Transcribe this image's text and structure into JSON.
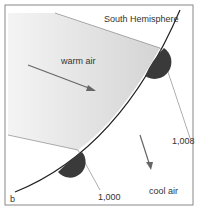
{
  "diagram": {
    "title": "South Hemisphere",
    "panel_label": "b",
    "regions": {
      "warm": "warm air",
      "cool": "cool air"
    },
    "isobars": [
      "1,008",
      "1,000"
    ],
    "front_type": "warm front",
    "colors": {
      "front_line": "#222222",
      "semicircle": "#3a3a3a",
      "warm_shade": "#d8d8d8",
      "isobar": "#777777",
      "arrow": "#666666",
      "border": "#888888"
    }
  }
}
